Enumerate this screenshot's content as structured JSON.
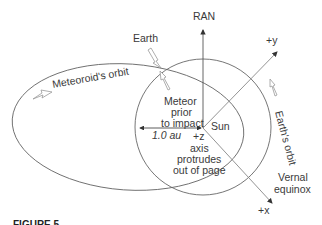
{
  "figure": {
    "labels": {
      "ran": "RAN",
      "plus_y": "+y",
      "plus_x": "+x",
      "earth": "Earth",
      "meteoroid_orbit": "Meteoroid's orbit",
      "meteor_line1": "Meteor",
      "meteor_line2": "prior",
      "meteor_line3": "to impact",
      "distance": "1.0 au",
      "z_line1": "+z",
      "sun": "Sun",
      "z_line2": "axis",
      "z_line3": "protrudes",
      "z_line4": "out of page",
      "earth_orbit": "Earth's orbit",
      "vernal_line1": "Vernal",
      "vernal_line2": "equinox"
    },
    "caption": "FIGURE 5",
    "colors": {
      "line": "#555555",
      "orbit": "#666666",
      "outline_arrow": "#9a9a9a",
      "text": "#3a3a3a"
    }
  }
}
